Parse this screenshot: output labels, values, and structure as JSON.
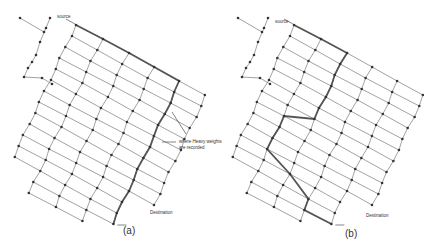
{
  "figure": {
    "panels": [
      {
        "id": "a",
        "caption": "(a)",
        "labels": {
          "source": "source",
          "destination": "Destination",
          "annotation_line1": "where Heavy weights",
          "annotation_line2": "are recorded"
        }
      },
      {
        "id": "b",
        "caption": "(b)",
        "labels": {
          "source": "source",
          "destination": "Destination"
        }
      }
    ],
    "colors": {
      "edge": "#8a8a8a",
      "node": "#333333",
      "highlight_path": "#555555",
      "background": "#ffffff"
    }
  }
}
